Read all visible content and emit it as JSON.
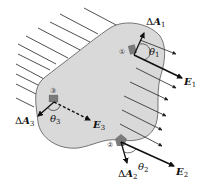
{
  "diagram": {
    "type": "electric-flux-closed-surface",
    "colors": {
      "surface_fill": "#d9d9d9",
      "surface_stroke": "#555555",
      "field_line": "#222222",
      "patch": "#7a7a7a"
    },
    "elements": [
      {
        "id": 1,
        "circle_label": "①",
        "area_label": "ΔA",
        "area_sub": "1",
        "field_label": "E",
        "field_sub": "1",
        "angle_label": "θ",
        "angle_sub": "1"
      },
      {
        "id": 2,
        "circle_label": "②",
        "area_label": "ΔA",
        "area_sub": "2",
        "field_label": "E",
        "field_sub": "2",
        "angle_label": "θ",
        "angle_sub": "2"
      },
      {
        "id": 3,
        "circle_label": "③",
        "area_label": "ΔA",
        "area_sub": "3",
        "field_label": "E",
        "field_sub": "3",
        "angle_label": "θ",
        "angle_sub": "3"
      }
    ]
  }
}
